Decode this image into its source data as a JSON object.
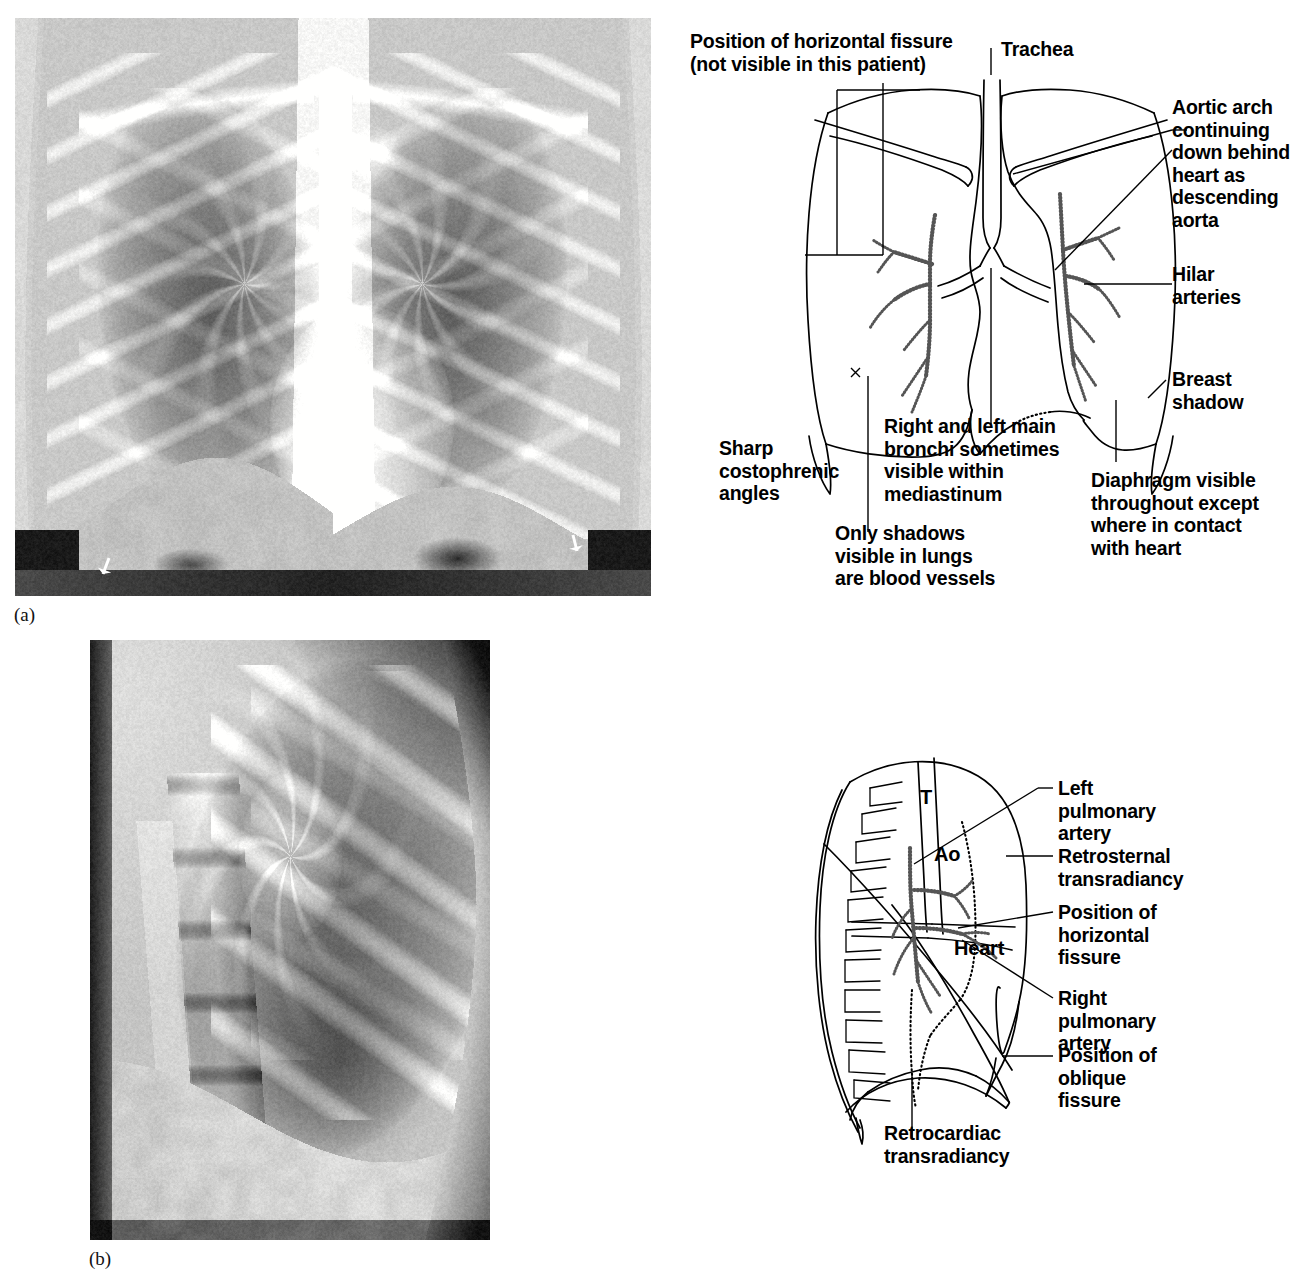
{
  "figure": {
    "panel_a_letter": "(a)",
    "panel_b_letter": "(b)"
  },
  "pa_diagram": {
    "labels": {
      "horizontal_fissure": "Position of horizontal fissure\n(not visible in this patient)",
      "trachea": "Trachea",
      "aortic_arch": "Aortic arch\ncontinuing\ndown behind\nheart as\ndescending\naorta",
      "hilar_arteries": "Hilar\narteries",
      "breast_shadow": "Breast\nshadow",
      "costophrenic": "Sharp\ncostophrenic\nangles",
      "main_bronchi": "Right and left main\nbronchi sometimes\nvisible within\nmediastinum",
      "diaphragm": "Diaphragm visible\nthroughout except\nwhere in contact\nwith heart",
      "blood_vessels": "Only shadows\nvisible in lungs\nare blood vessels"
    }
  },
  "lateral_diagram": {
    "labels": {
      "trachea_marker": "T",
      "aorta_marker": "Ao",
      "heart_marker": "Heart",
      "left_pulmonary_artery": "Left\npulmonary\nartery",
      "retrosternal": "Retrosternal\ntransradiancy",
      "horizontal_fissure": "Position of\nhorizontal\nfissure",
      "right_pulmonary_artery": "Right\npulmonary\nartery",
      "oblique_fissure": "Position of\noblique\nfissure",
      "retrocardiac": "Retrocardiac\ntransradiancy"
    }
  },
  "colors": {
    "ink": "#000000",
    "film_base": "#c9c9c4",
    "background": "#ffffff"
  }
}
